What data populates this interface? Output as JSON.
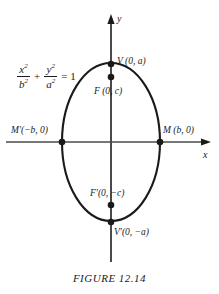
{
  "figure": {
    "caption": "FIGURE 12.14",
    "axes": {
      "x_label": "x",
      "y_label": "y"
    },
    "equation": {
      "term1_num_var": "x",
      "term1_num_exp": "2",
      "term1_den_var": "b",
      "term1_den_exp": "2",
      "operator": "+",
      "term2_num_var": "y",
      "term2_num_exp": "2",
      "term2_den_var": "a",
      "term2_den_exp": "2",
      "rhs": "= 1"
    },
    "points": [
      {
        "id": "v-top",
        "label": "V (0, a)",
        "x": 111,
        "y": 64,
        "marker": true
      },
      {
        "id": "f-top",
        "label": "F (0, c)",
        "x": 111,
        "y": 77,
        "marker": true
      },
      {
        "id": "m-prime",
        "label": "M′(−b, 0)",
        "x": 62,
        "y": 142,
        "marker": true
      },
      {
        "id": "m",
        "label": "M (b, 0)",
        "x": 160,
        "y": 142,
        "marker": true
      },
      {
        "id": "f-bot",
        "label": "F′(0, −c)",
        "x": 111,
        "y": 205,
        "marker": true
      },
      {
        "id": "v-bot",
        "label": "V′(0, −a)",
        "x": 111,
        "y": 222,
        "marker": true
      }
    ],
    "ellipse": {
      "center_x": 111,
      "center_y": 142,
      "semi_minor_b": 49,
      "semi_major_a": 79
    },
    "colors": {
      "ink": "#1a1a1a",
      "axis": "#4a4a4a",
      "background": "#ffffff"
    }
  }
}
